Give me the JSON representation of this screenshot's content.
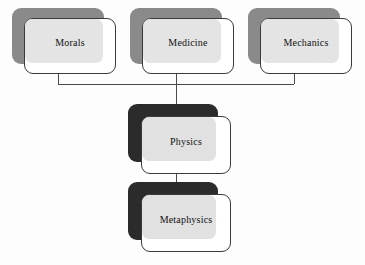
{
  "diagram": {
    "background_color": "#fdfdfd",
    "palette": {
      "top_shadow_fill": "#8a8a8a",
      "deep_shadow_fill": "#2b2b2b",
      "card_fill": "#ffffff",
      "card_stroke": "#3a3a3a",
      "overlap_wash": "#e2e2e2",
      "connector_stroke": "#4a4a4a",
      "label_color": "#111111"
    },
    "nodes": [
      {
        "id": "morals",
        "label": "Morals",
        "row": "top",
        "shadow_tone": "medium-gray"
      },
      {
        "id": "medicine",
        "label": "Medicine",
        "row": "top",
        "shadow_tone": "medium-gray"
      },
      {
        "id": "mechanics",
        "label": "Mechanics",
        "row": "top",
        "shadow_tone": "medium-gray"
      },
      {
        "id": "physics",
        "label": "Physics",
        "row": "mid",
        "shadow_tone": "dark"
      },
      {
        "id": "metaphysics",
        "label": "Metaphysics",
        "row": "base",
        "shadow_tone": "dark"
      }
    ],
    "connections": [
      {
        "from": "morals",
        "to": "physics",
        "style": "orthogonal-bus"
      },
      {
        "from": "medicine",
        "to": "physics",
        "style": "orthogonal-bus"
      },
      {
        "from": "mechanics",
        "to": "physics",
        "style": "orthogonal-bus"
      },
      {
        "from": "physics",
        "to": "metaphysics",
        "style": "straight-vertical"
      }
    ]
  }
}
